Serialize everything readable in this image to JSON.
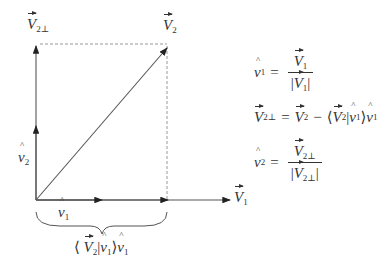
{
  "diagram": {
    "type": "gram-schmidt-orthogonalization",
    "colors": {
      "line": "#333333",
      "dashed": "#999999",
      "background": "#ffffff"
    },
    "labels": {
      "v2_perp": {
        "main": "V",
        "sub": "2⊥"
      },
      "v2": {
        "main": "V",
        "sub": "2"
      },
      "v1": {
        "main": "V",
        "sub": "1"
      },
      "v1_hat": {
        "main": "v",
        "sub": "1"
      },
      "v2_hat": {
        "main": "v",
        "sub": "2"
      },
      "projection": {
        "open": "⟨",
        "vec": "V",
        "vec_sub": "2",
        "bar": "|",
        "hat": "v",
        "hat_sub": "1",
        "close": "⟩",
        "tail_hat": "v",
        "tail_sub": "1"
      }
    },
    "equations": [
      {
        "lhs": {
          "main": "v",
          "sub": "1",
          "hat": true
        },
        "eq": "=",
        "num": {
          "main": "V",
          "sub": "1"
        },
        "den": {
          "open": "|",
          "main": "V",
          "sub": "1",
          "close": "|"
        }
      },
      {
        "lhs": {
          "main": "V",
          "sub": "2⊥"
        },
        "eq": "=",
        "rhs_v2": {
          "main": "V",
          "sub": "2"
        },
        "minus": "−",
        "open": "⟨",
        "inner_v": {
          "main": "V",
          "sub": "2"
        },
        "bar": "|",
        "inner_hat": {
          "main": "v",
          "sub": "1"
        },
        "close": "⟩",
        "tail_hat": {
          "main": "v",
          "sub": "1"
        }
      },
      {
        "lhs": {
          "main": "v",
          "sub": "2",
          "hat": true
        },
        "eq": "=",
        "num": {
          "main": "V",
          "sub": "2⊥"
        },
        "den": {
          "open": "|",
          "main": "V",
          "sub": "2⊥",
          "close": "|"
        }
      }
    ]
  }
}
